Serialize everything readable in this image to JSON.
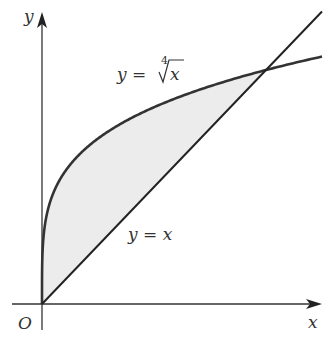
{
  "chart_data": {
    "type": "line",
    "title": "",
    "xlabel": "x",
    "ylabel": "y",
    "origin_label": "O",
    "xlim": [
      0,
      1.25
    ],
    "ylim": [
      0,
      1.25
    ],
    "grid": false,
    "shaded_region": {
      "between": [
        "y = ∜x",
        "y = x"
      ],
      "x_range": [
        0,
        1
      ],
      "color": "#ececec"
    },
    "series": [
      {
        "name": "y = ∜x",
        "label_prefix": "y = ",
        "root_index": "4",
        "radicand": "x",
        "function": "x^(1/4)",
        "x_range": [
          0,
          1.25
        ]
      },
      {
        "name": "y = x",
        "label": "y = x",
        "function": "x",
        "x_range": [
          0,
          1.25
        ]
      }
    ],
    "intersection": [
      1,
      1
    ]
  }
}
